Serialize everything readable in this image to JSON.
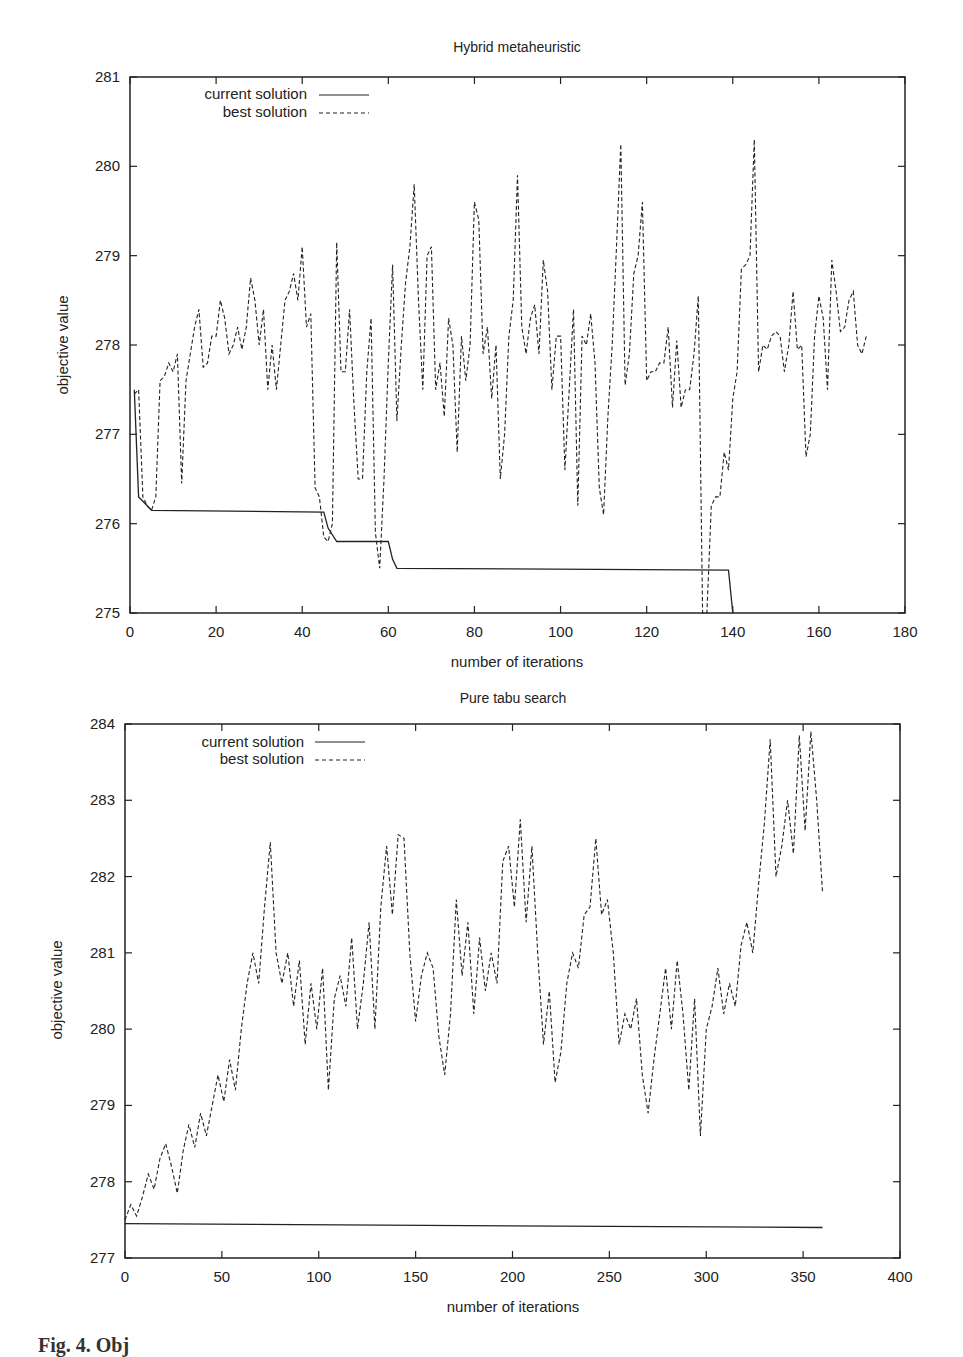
{
  "caption": "Fig. 4. Obj",
  "chart_data": [
    {
      "type": "line",
      "title": "Hybrid metaheuristic",
      "xlabel": "number of iterations",
      "ylabel": "objective value",
      "xlim": [
        0,
        180
      ],
      "ylim": [
        275,
        281
      ],
      "xticks": [
        0,
        20,
        40,
        60,
        80,
        100,
        120,
        140,
        160,
        180
      ],
      "yticks": [
        275,
        276,
        277,
        278,
        279,
        280,
        281
      ],
      "grid": false,
      "legend_position": "top-left",
      "series": [
        {
          "name": "current solution",
          "style": "solid",
          "x": [
            1,
            2,
            3,
            5,
            45,
            46,
            48,
            60,
            61,
            62,
            139,
            140
          ],
          "y": [
            277.5,
            276.3,
            276.25,
            276.15,
            276.13,
            275.95,
            275.8,
            275.8,
            275.6,
            275.5,
            275.48,
            275.0
          ]
        },
        {
          "name": "best solution",
          "style": "dashed",
          "x": [
            1,
            2,
            3,
            4,
            5,
            6,
            7,
            8,
            9,
            10,
            11,
            12,
            13,
            14,
            15,
            16,
            17,
            18,
            19,
            20,
            21,
            22,
            23,
            24,
            25,
            26,
            27,
            28,
            29,
            30,
            31,
            32,
            33,
            34,
            35,
            36,
            37,
            38,
            39,
            40,
            41,
            42,
            43,
            44,
            45,
            46,
            47,
            48,
            49,
            50,
            51,
            52,
            53,
            54,
            55,
            56,
            57,
            58,
            59,
            60,
            61,
            62,
            63,
            64,
            65,
            66,
            67,
            68,
            69,
            70,
            71,
            72,
            73,
            74,
            75,
            76,
            77,
            78,
            79,
            80,
            81,
            82,
            83,
            84,
            85,
            86,
            87,
            88,
            89,
            90,
            91,
            92,
            93,
            94,
            95,
            96,
            97,
            98,
            99,
            100,
            101,
            102,
            103,
            104,
            105,
            106,
            107,
            108,
            109,
            110,
            111,
            112,
            113,
            114,
            115,
            116,
            117,
            118,
            119,
            120,
            121,
            122,
            123,
            124,
            125,
            126,
            127,
            128,
            129,
            130,
            131,
            132,
            133,
            134,
            135,
            136,
            137,
            138,
            139,
            140,
            141,
            142,
            143,
            144,
            145,
            146,
            147,
            148,
            149,
            150,
            151,
            152,
            153,
            154,
            155,
            156,
            157,
            158,
            159,
            160,
            161,
            162,
            163,
            164,
            165,
            166,
            167,
            168,
            169,
            170,
            171,
            172,
            173,
            174,
            175,
            176,
            177,
            178
          ],
          "y": [
            277.45,
            277.5,
            276.3,
            276.2,
            276.15,
            276.3,
            277.6,
            277.65,
            277.8,
            277.7,
            277.9,
            276.45,
            277.6,
            277.9,
            278.2,
            278.4,
            277.75,
            277.8,
            278.1,
            278.1,
            278.5,
            278.3,
            277.9,
            278.0,
            278.2,
            277.95,
            278.2,
            278.75,
            278.5,
            278.0,
            278.4,
            277.5,
            278.0,
            277.5,
            278.0,
            278.5,
            278.6,
            278.8,
            278.5,
            279.1,
            278.2,
            278.35,
            276.4,
            276.3,
            275.85,
            275.8,
            276.0,
            279.15,
            277.7,
            277.7,
            278.4,
            277.35,
            276.5,
            276.5,
            277.7,
            278.3,
            275.9,
            275.5,
            276.5,
            277.8,
            278.9,
            277.15,
            278.0,
            278.7,
            279.1,
            279.8,
            278.5,
            277.5,
            279.0,
            279.1,
            277.5,
            277.8,
            277.2,
            278.3,
            278.0,
            276.8,
            278.1,
            277.6,
            278.0,
            279.6,
            279.4,
            277.9,
            278.2,
            277.4,
            278.0,
            276.5,
            277.0,
            278.1,
            278.5,
            279.9,
            278.2,
            277.9,
            278.3,
            278.45,
            277.9,
            278.95,
            278.6,
            277.5,
            278.1,
            278.1,
            276.6,
            277.5,
            278.4,
            276.2,
            278.1,
            278.0,
            278.35,
            277.8,
            276.4,
            276.1,
            277.2,
            278.0,
            279.1,
            280.25,
            277.55,
            277.9,
            278.8,
            279.0,
            279.6,
            277.6,
            277.7,
            277.7,
            277.8,
            277.8,
            278.2,
            277.3,
            278.05,
            277.3,
            277.5,
            277.5,
            277.9,
            278.55,
            275.0,
            275.0,
            276.2,
            276.3,
            276.3,
            276.8,
            276.6,
            277.4,
            277.7,
            278.85,
            278.9,
            279.0,
            280.3,
            277.7,
            278.0,
            277.95,
            278.1,
            278.15,
            278.1,
            277.7,
            278.0,
            278.6,
            277.95,
            278.0,
            276.75,
            277.0,
            278.1,
            278.55,
            278.3,
            277.5,
            278.95,
            278.6,
            278.15,
            278.2,
            278.5,
            278.6,
            278.0,
            277.9,
            278.1
          ]
        }
      ]
    },
    {
      "type": "line",
      "title": "Pure tabu search",
      "xlabel": "number of iterations",
      "ylabel": "objective value",
      "xlim": [
        0,
        400
      ],
      "ylim": [
        277,
        284
      ],
      "xticks": [
        0,
        50,
        100,
        150,
        200,
        250,
        300,
        350,
        400
      ],
      "yticks": [
        277,
        278,
        279,
        280,
        281,
        282,
        283,
        284
      ],
      "grid": false,
      "legend_position": "top-left",
      "series": [
        {
          "name": "current solution",
          "style": "solid",
          "x": [
            0,
            360
          ],
          "y": [
            277.45,
            277.4
          ]
        },
        {
          "name": "best solution",
          "style": "dashed",
          "x": [
            0,
            3,
            6,
            9,
            12,
            15,
            18,
            21,
            24,
            27,
            30,
            33,
            36,
            39,
            42,
            45,
            48,
            51,
            54,
            57,
            60,
            63,
            66,
            69,
            72,
            75,
            78,
            81,
            84,
            87,
            90,
            93,
            96,
            99,
            102,
            105,
            108,
            111,
            114,
            117,
            120,
            123,
            126,
            129,
            132,
            135,
            138,
            141,
            144,
            147,
            150,
            153,
            156,
            159,
            162,
            165,
            168,
            171,
            174,
            177,
            180,
            183,
            186,
            189,
            192,
            195,
            198,
            201,
            204,
            207,
            210,
            213,
            216,
            219,
            222,
            225,
            228,
            231,
            234,
            237,
            240,
            243,
            246,
            249,
            252,
            255,
            258,
            261,
            264,
            267,
            270,
            273,
            276,
            279,
            282,
            285,
            288,
            291,
            294,
            297,
            300,
            303,
            306,
            309,
            312,
            315,
            318,
            321,
            324,
            327,
            330,
            333,
            336,
            339,
            342,
            345,
            348,
            351,
            354,
            357,
            360
          ],
          "y": [
            277.5,
            277.7,
            277.55,
            277.8,
            278.1,
            277.9,
            278.3,
            278.5,
            278.2,
            277.85,
            278.4,
            278.75,
            278.45,
            278.9,
            278.6,
            279.0,
            279.4,
            279.05,
            279.6,
            279.2,
            280.0,
            280.6,
            281.0,
            280.6,
            281.6,
            282.45,
            281.0,
            280.6,
            281.0,
            280.3,
            280.9,
            279.8,
            280.6,
            280.0,
            280.8,
            279.2,
            280.4,
            280.7,
            280.3,
            281.2,
            280.0,
            280.6,
            281.4,
            280.0,
            281.6,
            282.4,
            281.5,
            282.55,
            282.5,
            281.0,
            280.1,
            280.7,
            281.0,
            280.8,
            279.9,
            279.4,
            280.2,
            281.7,
            280.7,
            281.4,
            280.2,
            281.2,
            280.5,
            281.0,
            280.6,
            282.2,
            282.4,
            281.6,
            282.75,
            281.4,
            282.4,
            281.0,
            279.8,
            280.5,
            279.3,
            279.7,
            280.6,
            281.0,
            280.8,
            281.5,
            281.6,
            282.5,
            281.5,
            281.7,
            281.0,
            279.8,
            280.2,
            280.0,
            280.4,
            279.4,
            278.9,
            279.6,
            280.2,
            280.8,
            280.0,
            280.9,
            280.2,
            279.2,
            280.4,
            278.6,
            280.0,
            280.3,
            280.8,
            280.2,
            280.6,
            280.3,
            281.1,
            281.4,
            281.0,
            281.9,
            282.7,
            283.8,
            282.0,
            282.4,
            283.0,
            282.3,
            283.85,
            282.6,
            283.9,
            283.0,
            281.8
          ]
        }
      ]
    }
  ]
}
